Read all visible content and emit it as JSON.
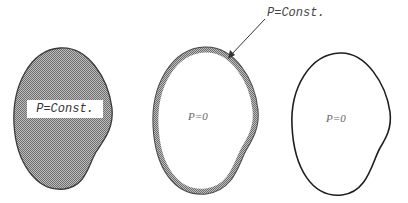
{
  "figure": {
    "panels": [
      {
        "id": "filled-region",
        "style": "fully hatched (gray fill)",
        "label": "P=Const."
      },
      {
        "id": "hatched-boundary",
        "style": "hatched boundary band, white interior",
        "label": "P=0",
        "callout_label": "P=Const."
      },
      {
        "id": "plain-outline",
        "style": "plain black outline, white interior",
        "label": "P=0"
      }
    ],
    "colors": {
      "hatch_fill": "#9a9a9a",
      "outline": "#222222",
      "background": "#ffffff"
    }
  }
}
